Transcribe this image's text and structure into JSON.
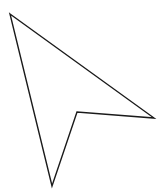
{
  "figure": {
    "shape": "cursor-arrow-outline",
    "stroke_color": "#1a1a1a",
    "fill_color": "#ffffff",
    "background": "#ffffff",
    "points": "10,14 154,118 77,112 52,186"
  }
}
